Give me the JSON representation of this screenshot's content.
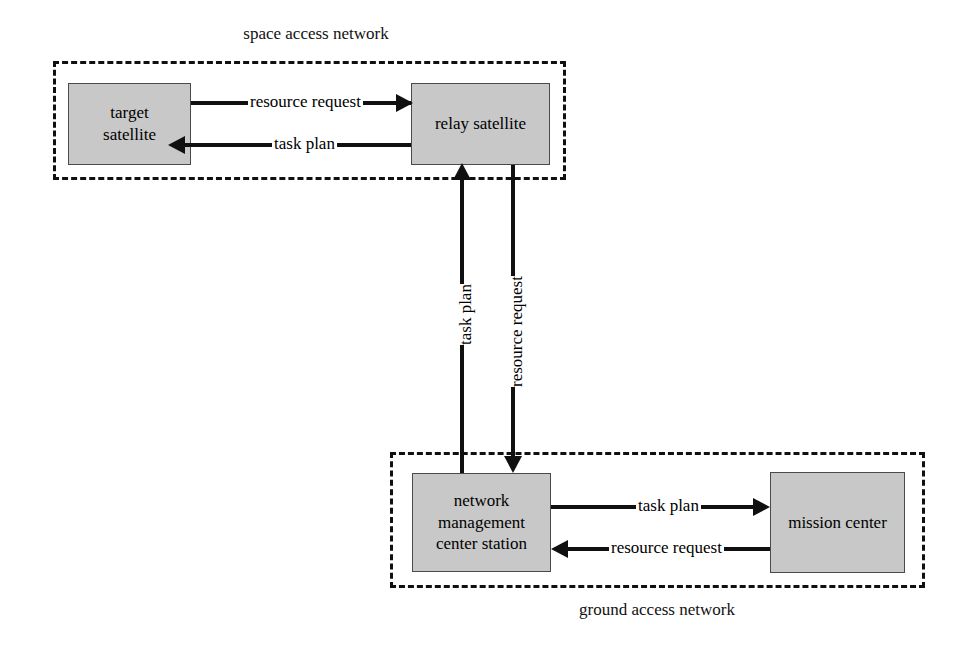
{
  "diagram": {
    "colors": {
      "node_fill": "#c8c8c8",
      "node_border": "#4a4a4a",
      "line": "#101010",
      "background": "#ffffff"
    },
    "zones": [
      {
        "id": "space-access-network",
        "caption": "space access network",
        "caption_position": "above"
      },
      {
        "id": "ground-access-network",
        "caption": "ground access network",
        "caption_position": "below"
      }
    ],
    "nodes": [
      {
        "id": "target-satellite",
        "label_line1": "target",
        "label_line2": "satellite",
        "zone": "space-access-network"
      },
      {
        "id": "relay-satellite",
        "label_line1": "relay satellite",
        "label_line2": "",
        "zone": "space-access-network"
      },
      {
        "id": "network-management-center-station",
        "label_line1": "network",
        "label_line2": "management",
        "label_line3": "center station",
        "zone": "ground-access-network"
      },
      {
        "id": "mission-center",
        "label_line1": "mission center",
        "label_line2": "",
        "zone": "ground-access-network"
      }
    ],
    "edges": [
      {
        "id": "target-to-relay",
        "label": "resource request",
        "from": "target-satellite",
        "to": "relay-satellite",
        "direction": "right"
      },
      {
        "id": "relay-to-target",
        "label": "task plan",
        "from": "relay-satellite",
        "to": "target-satellite",
        "direction": "left"
      },
      {
        "id": "nmcs-to-relay",
        "label": "task plan",
        "from": "network-management-center-station",
        "to": "relay-satellite",
        "direction": "up"
      },
      {
        "id": "relay-to-nmcs",
        "label": "resource request",
        "from": "relay-satellite",
        "to": "network-management-center-station",
        "direction": "down"
      },
      {
        "id": "nmcs-to-mission",
        "label": "task plan",
        "from": "network-management-center-station",
        "to": "mission-center",
        "direction": "right"
      },
      {
        "id": "mission-to-nmcs",
        "label": "resource request",
        "from": "mission-center",
        "to": "network-management-center-station",
        "direction": "left"
      }
    ]
  }
}
